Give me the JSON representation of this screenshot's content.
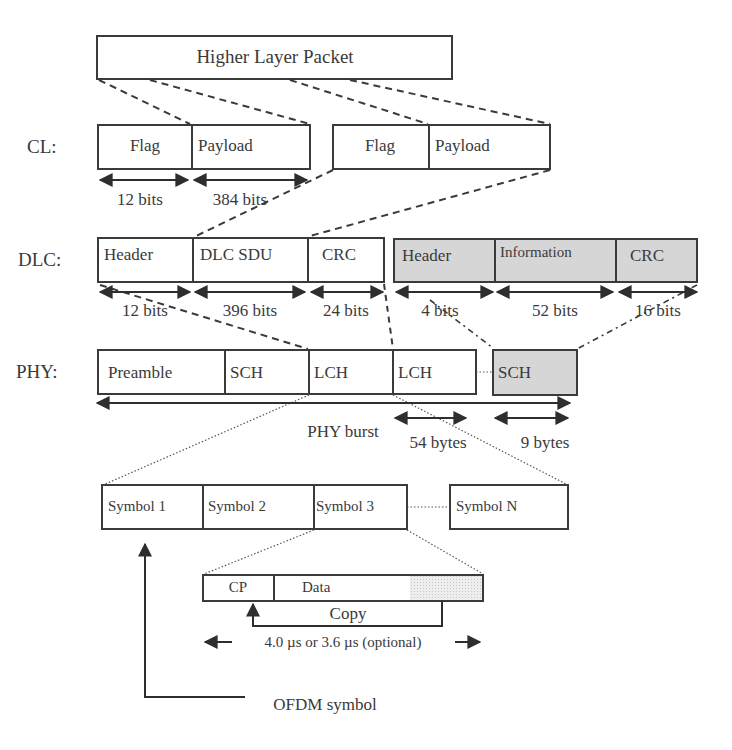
{
  "colors": {
    "line": "#3a3a3a",
    "shaded": "#d6d6d6",
    "hatch": "#e4e4e4",
    "background": "#ffffff"
  },
  "higher_layer": {
    "label": "Higher Layer Packet"
  },
  "layers": {
    "cl": "CL:",
    "dlc": "DLC:",
    "phy": "PHY:"
  },
  "cl": {
    "segment1": {
      "flag": "Flag",
      "payload": "Payload"
    },
    "segment2": {
      "flag": "Flag",
      "payload": "Payload"
    },
    "sizes": {
      "flag": "12 bits",
      "payload": "384 bits"
    }
  },
  "dlc": {
    "data_pdu": {
      "fields": [
        "Header",
        "DLC SDU",
        "CRC"
      ],
      "sizes": [
        "12 bits",
        "396 bits",
        "24 bits"
      ]
    },
    "control_pdu": {
      "fields": [
        "Header",
        "Information",
        "CRC"
      ],
      "sizes": [
        "4 bits",
        "52 bits",
        "16 bits"
      ]
    }
  },
  "phy": {
    "fields": [
      "Preamble",
      "SCH",
      "LCH",
      "LCH",
      "SCH"
    ],
    "burst_label": "PHY burst",
    "lch_size": "54 bytes",
    "sch_size": "9 bytes"
  },
  "symbols": {
    "items": [
      "Symbol 1",
      "Symbol 2",
      "Symbol 3",
      "Symbol N"
    ]
  },
  "ofdm": {
    "cp": "CP",
    "data": "Data",
    "copy": "Copy",
    "duration": "4.0 µs or 3.6 µs (optional)",
    "symbol_label": "OFDM symbol"
  }
}
